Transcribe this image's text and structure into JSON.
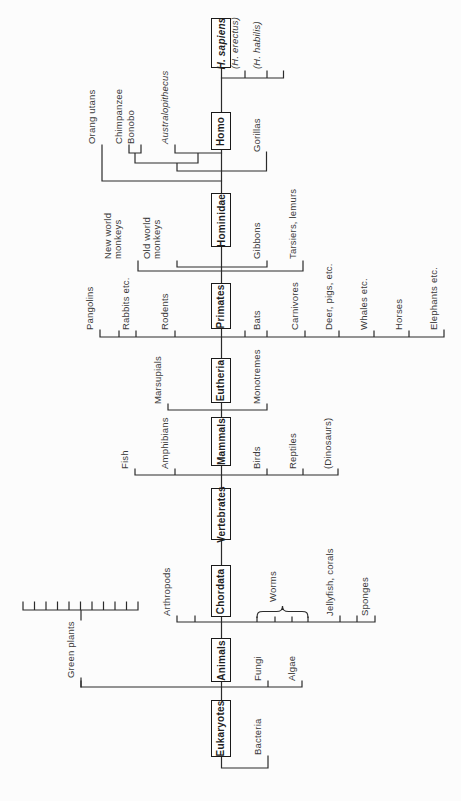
{
  "figure": {
    "colors": {
      "line": "#2b2b2b",
      "text": "#3a3a3a",
      "background": "#fcfcfc",
      "box_border": "#1a1a1a",
      "box_fill": "#ffffff"
    },
    "trunk_boxes": [
      "Eukaryotes",
      "Animals",
      "Chordata",
      "Vertebrates",
      "Mammals",
      "Eutheria",
      "Primates",
      "Hominidae",
      "Homo",
      "H. sapiens"
    ],
    "branches": {
      "h_sapiens": [
        "(H. erectus)",
        "(H. habilis)"
      ],
      "homo": [
        "Orang utans",
        "Chimpanzee",
        "Bonobo",
        "Australopithecus",
        "Gorillas"
      ],
      "hominidae": [
        "New world\nmonkeys",
        "Old world\nmonkeys",
        "Gibbons",
        "Tarsiers, lemurs"
      ],
      "primates": [
        "Pangolins",
        "Rabbits etc.",
        "Rodents",
        "Bats",
        "Carnivores",
        "Deer, pigs, etc.",
        "Whales etc.",
        "Horses",
        "Elephants etc."
      ],
      "eutheria": [
        "Marsupials",
        "Monotremes"
      ],
      "mammals": [
        "Fish",
        "Amphibians",
        "Birds",
        "Reptiles",
        "(Dinosaurs)"
      ],
      "animals": [
        "Arthropods",
        "Worms",
        "Jellyfish, corals",
        "Sponges"
      ],
      "eukaryotes": [
        "Green plants",
        "Fungi",
        "Algae"
      ],
      "root": [
        "Bacteria"
      ]
    }
  }
}
